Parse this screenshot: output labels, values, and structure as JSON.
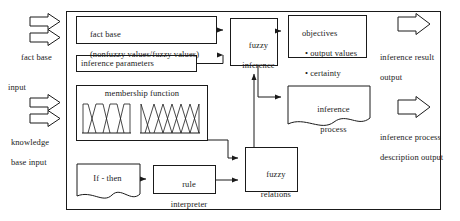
{
  "diagram": {
    "frame_label": "system-boundary",
    "inputs": [
      {
        "id": "fact-base-input",
        "label": "fact base\ninput",
        "arrow_count": 2
      },
      {
        "id": "knowledge-base-input",
        "label": "knowledge\nbase input",
        "arrow_count": 2
      }
    ],
    "outputs": [
      {
        "id": "inference-result-output",
        "label": "inference result\noutput",
        "arrow_count": 1
      },
      {
        "id": "inference-process-output",
        "label": "inference process\ndescription output",
        "arrow_count": 1
      }
    ],
    "boxes": [
      {
        "id": "fact-base",
        "shape": "rect",
        "line1": "fact base",
        "line2": "(nonfuzzy values/fuzzy values)"
      },
      {
        "id": "inference-parameters",
        "shape": "rect",
        "line1": "inference parameters",
        "line2": ""
      },
      {
        "id": "membership-function",
        "shape": "rect",
        "line1": "membership function",
        "line2": ""
      },
      {
        "id": "if-then",
        "shape": "document",
        "line1": "If - then",
        "line2": ""
      },
      {
        "id": "rule-interpreter",
        "shape": "rect",
        "line1": "rule",
        "line2": "interpreter"
      },
      {
        "id": "fuzzy-inference",
        "shape": "rect",
        "line1": "fuzzy",
        "line2": "inference"
      },
      {
        "id": "fuzzy-relations",
        "shape": "rect",
        "line1": "fuzzy",
        "line2": "relations"
      },
      {
        "id": "objectives",
        "shape": "rect",
        "line1": "objectives",
        "bullets": [
          "output values",
          "certainty"
        ]
      },
      {
        "id": "inference-process",
        "shape": "document",
        "line1": "inference",
        "line2": "process"
      }
    ],
    "membership_plots": [
      {
        "id": "trapezoid-set",
        "type": "trapezoidal",
        "count": 4
      },
      {
        "id": "triangle-set",
        "type": "triangular",
        "count": 6
      }
    ],
    "colors": {
      "stroke": "#1a1a1a",
      "fill": "#ffffff",
      "text": "#1a1a1a"
    }
  },
  "labels": {
    "fact_base_input": "fact base",
    "fact_base_input2": "input",
    "knowledge_base_input": "knowledge",
    "knowledge_base_input2": "base input",
    "inference_result_output": "inference result",
    "inference_result_output2": "output",
    "inference_process_output": "inference process",
    "inference_process_output2": "description output",
    "fact_base_l1": "fact base",
    "fact_base_l2": "(nonfuzzy values/fuzzy values)",
    "inference_parameters": "inference parameters",
    "membership_function": "membership function",
    "if_then": "If - then",
    "rule_interpreter_l1": "rule",
    "rule_interpreter_l2": "interpreter",
    "fuzzy_inference_l1": "fuzzy",
    "fuzzy_inference_l2": "inference",
    "fuzzy_relations_l1": "fuzzy",
    "fuzzy_relations_l2": "relations",
    "objectives_title": "objectives",
    "objectives_b1": "• output values",
    "objectives_b2": "• certainty",
    "inference_process_l1": "inference",
    "inference_process_l2": "process"
  }
}
